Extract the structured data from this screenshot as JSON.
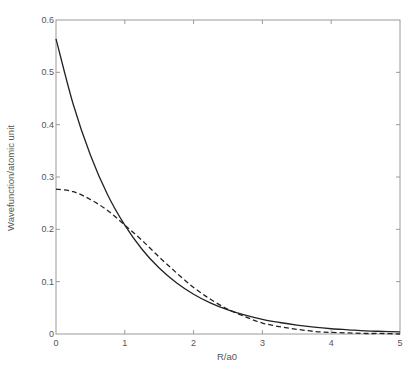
{
  "chart_data": {
    "type": "line",
    "title": "",
    "xlabel": "R/a0",
    "ylabel": "Wavefunction/atomic unit",
    "xlim": [
      0,
      5
    ],
    "ylim": [
      0,
      0.6
    ],
    "xticks": [
      0,
      1,
      2,
      3,
      4,
      5
    ],
    "xtick_labels": [
      "0",
      "1",
      "2",
      "3",
      "4",
      "5"
    ],
    "yticks": [
      0,
      0.1,
      0.2,
      0.3,
      0.4,
      0.5,
      0.6
    ],
    "ytick_labels": [
      "0",
      "0.1",
      "0.2",
      "0.3",
      "0.4",
      "0.5",
      "0.6"
    ],
    "grid": false,
    "legend": null,
    "x": [
      0,
      0.25,
      0.5,
      0.75,
      1.0,
      1.25,
      1.5,
      1.75,
      2.0,
      2.25,
      2.5,
      2.75,
      3.0,
      3.25,
      3.5,
      3.75,
      4.0,
      4.25,
      4.5,
      4.75,
      5.0
    ],
    "series": [
      {
        "name": "solid",
        "style": "solid",
        "color": "#222222",
        "values": [
          0.564,
          0.439,
          0.342,
          0.266,
          0.208,
          0.162,
          0.126,
          0.098,
          0.076,
          0.059,
          0.046,
          0.036,
          0.028,
          0.022,
          0.017,
          0.013,
          0.01,
          0.008,
          0.006,
          0.005,
          0.004
        ]
      },
      {
        "name": "dashed",
        "style": "dashed",
        "color": "#222222",
        "values": [
          0.277,
          0.272,
          0.257,
          0.236,
          0.208,
          0.179,
          0.147,
          0.117,
          0.089,
          0.066,
          0.047,
          0.033,
          0.021,
          0.014,
          0.009,
          0.005,
          0.003,
          0.002,
          0.001,
          0.001,
          0.0
        ]
      }
    ]
  },
  "layout": {
    "plot_left": 56,
    "plot_top": 20,
    "plot_right": 400,
    "plot_bottom": 334
  }
}
